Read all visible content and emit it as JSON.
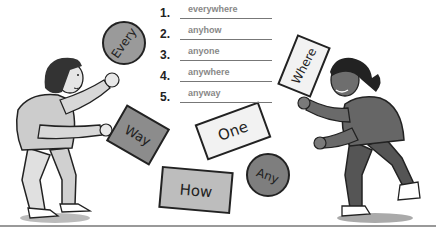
{
  "exercise": {
    "items": [
      {
        "number": "1.",
        "answer": "everywhere"
      },
      {
        "number": "2.",
        "answer": "anyhow"
      },
      {
        "number": "3.",
        "answer": "anyone"
      },
      {
        "number": "4.",
        "answer": "anywhere"
      },
      {
        "number": "5.",
        "answer": "anyway"
      }
    ]
  },
  "cards": {
    "every": "Every",
    "way": "Way",
    "one": "One",
    "how": "How",
    "any": "Any",
    "where": "Where"
  }
}
